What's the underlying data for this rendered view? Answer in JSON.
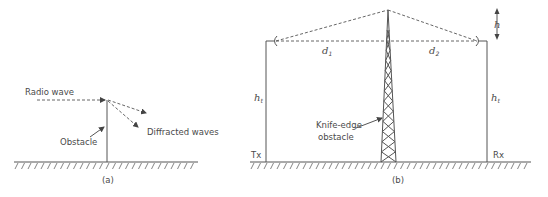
{
  "figure_a": {
    "caption": "(a)",
    "radio_wave_label": "Radio wave",
    "diffracted_label": "Diffracted waves",
    "obstacle_label": "Obstacle"
  },
  "figure_b": {
    "caption": "(b)",
    "d1_label": "d",
    "d1_sub": "1",
    "d2_label": "d",
    "d2_sub": "2",
    "h_label": "h",
    "ht_left_label": "h",
    "ht_left_sub": "t",
    "ht_right_label": "h",
    "ht_right_sub": "t",
    "tx_label": "Tx",
    "rx_label": "Rx",
    "knife_edge_line1": "Knife-edge",
    "knife_edge_line2": "obstacle"
  }
}
